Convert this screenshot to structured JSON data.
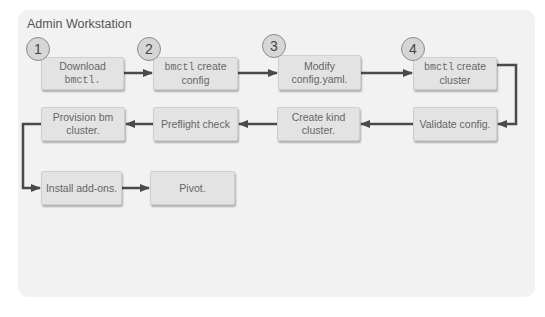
{
  "diagram": {
    "title": "Admin Workstation",
    "colors": {
      "panel_bg": "#f2f2f2",
      "box_bg": "#e3e3e3",
      "arrow": "#4a4a4a",
      "text": "#666666",
      "step_badge_bg": "#d6d6d6"
    },
    "steps": [
      {
        "badge": "1",
        "line1_mono": "",
        "line1": "Download",
        "line2_mono": "bmctl.",
        "line2": ""
      },
      {
        "badge": "2",
        "line1_mono": "bmctl",
        "line1": " create",
        "line2_mono": "",
        "line2": "config"
      },
      {
        "badge": "3",
        "line1_mono": "",
        "line1": "Modify",
        "line2_mono": "",
        "line2": "config.yaml."
      },
      {
        "badge": "4",
        "line1_mono": "bmctl",
        "line1": " create",
        "line2_mono": "",
        "line2": "cluster"
      }
    ],
    "row2": [
      {
        "line1": "Provision bm",
        "line2": "cluster."
      },
      {
        "line1": "Preflight check",
        "line2": ""
      },
      {
        "line1": "Create kind",
        "line2": "cluster."
      },
      {
        "line1": "Validate config.",
        "line2": ""
      }
    ],
    "row3": [
      {
        "line1": "Install add-ons."
      },
      {
        "line1": "Pivot."
      }
    ],
    "flow_order": [
      "Download bmctl.",
      "bmctl create config",
      "Modify config.yaml.",
      "bmctl create cluster",
      "Validate config.",
      "Create kind cluster.",
      "Preflight check",
      "Provision bm cluster.",
      "Install add-ons.",
      "Pivot."
    ]
  }
}
